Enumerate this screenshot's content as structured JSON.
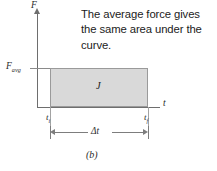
{
  "figure": {
    "caption": "(b)",
    "annotation": {
      "line1": "The average force gives",
      "line2": "the same area under the",
      "line3": "curve."
    },
    "axes": {
      "y_label": "F",
      "x_label": "t"
    },
    "labels": {
      "f_avg_main": "F",
      "f_avg_sub": "avg",
      "area_label": "J",
      "t_initial_main": "t",
      "t_initial_sub": "i",
      "t_final_main": "t",
      "t_final_sub": "f",
      "delta_t": "Δt"
    },
    "colors": {
      "background": "#ffffff",
      "area_fill": "#d9d9d9",
      "area_stroke": "#9a9a9a",
      "axis": "#6e6e6e",
      "text": "#1b1b1b"
    }
  },
  "chart_data": {
    "type": "area",
    "title": "",
    "xlabel": "t",
    "ylabel": "F",
    "annotation": "The average force gives the same area under the curve.",
    "caption": "(b)",
    "series": [
      {
        "name": "J",
        "description": "Constant average force rectangle; area equals impulse J",
        "x": [
          "t_i",
          "t_f"
        ],
        "y": [
          "F_avg",
          "F_avg"
        ],
        "fill": "#d9d9d9"
      }
    ],
    "annotations": [
      {
        "text": "F_avg",
        "type": "y-tick"
      },
      {
        "text": "t_i",
        "type": "x-tick"
      },
      {
        "text": "t_f",
        "type": "x-tick"
      },
      {
        "text": "J",
        "type": "region-label"
      },
      {
        "text": "Δt",
        "type": "dimension",
        "from": "t_i",
        "to": "t_f"
      }
    ],
    "grid": false,
    "legend": "none"
  }
}
